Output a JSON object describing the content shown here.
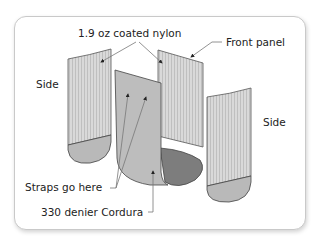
{
  "diagram": {
    "labels": {
      "nylon": "1.9 oz coated nylon",
      "front_panel": "Front panel",
      "side_left": "Side",
      "side_right": "Side",
      "straps": "Straps go here",
      "cordura": "330 denier Cordura"
    },
    "colors": {
      "nylon_panel": "#d6d6d6",
      "stripe": "#bdbdbd",
      "cordura_panel": "#b9b9b9",
      "cordura_dark": "#7a7a7a",
      "outline": "#444444",
      "leader": "#555555"
    }
  }
}
